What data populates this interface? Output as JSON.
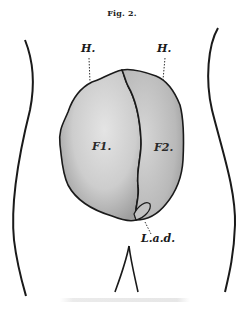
{
  "figure": {
    "title": "Fig. 2.",
    "labels": {
      "h_left": "H.",
      "h_right": "H.",
      "f1": "F1.",
      "f2": "F2.",
      "lad": "L.a.d."
    },
    "colors": {
      "ink": "#1a1a1a",
      "mass_fill": "#cfcfcf",
      "mass_shade": "#a9a9a9",
      "background": "#ffffff"
    }
  }
}
